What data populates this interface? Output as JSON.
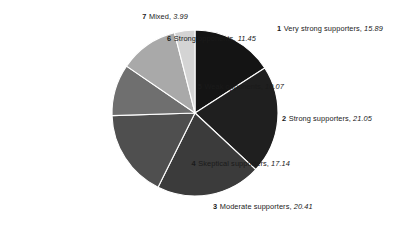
{
  "chart_data": {
    "type": "pie",
    "title": "",
    "subtitle": "",
    "xlabel": "",
    "ylabel": "",
    "legend_position": "outside-labels",
    "grid": false,
    "total": 100.0,
    "units": "percent",
    "start_angle_deg": 0,
    "direction": "clockwise",
    "categories": [
      "Very strong supporters",
      "Strong supporters",
      "Moderate supporters",
      "Skeptical supporters",
      "Weak opponents",
      "Strong opponents",
      "Mixed"
    ],
    "values": [
      15.89,
      21.05,
      20.41,
      17.14,
      10.07,
      11.45,
      3.99
    ],
    "colors": [
      "#141414",
      "#1f1f1f",
      "#3b3b3b",
      "#4f4f4f",
      "#6f6f6f",
      "#a9a9a9",
      "#d4d4d4"
    ],
    "slices": [
      {
        "index": "1",
        "name": "Very strong supporters",
        "value": "15.89",
        "color": "#141414"
      },
      {
        "index": "2",
        "name": "Strong supporters",
        "value": "21.05",
        "color": "#1f1f1f"
      },
      {
        "index": "3",
        "name": "Moderate supporters",
        "value": "20.41",
        "color": "#3b3b3b"
      },
      {
        "index": "4",
        "name": "Skeptical supporters",
        "value": "17.14",
        "color": "#4f4f4f"
      },
      {
        "index": "5",
        "name": "Weak opponents",
        "value": "10.07",
        "color": "#6f6f6f"
      },
      {
        "index": "6",
        "name": "Strong opponents",
        "value": "11.45",
        "color": "#a9a9a9"
      },
      {
        "index": "7",
        "name": "Mixed",
        "value": "3.99",
        "color": "#d4d4d4"
      }
    ]
  },
  "geometry": {
    "center_x": 195,
    "center_y": 113,
    "radius": 83
  },
  "labels": [
    {
      "id": "1",
      "left": 277,
      "top": 25,
      "anchor": "start"
    },
    {
      "id": "2",
      "left": 282,
      "top": 115,
      "anchor": "start"
    },
    {
      "id": "3",
      "left": 213,
      "top": 203,
      "anchor": "start"
    },
    {
      "id": "4",
      "right": 116,
      "top": 160,
      "anchor": "end"
    },
    {
      "id": "5",
      "right": 122,
      "top": 83,
      "anchor": "end"
    },
    {
      "id": "6",
      "right": 150,
      "top": 35,
      "anchor": "end"
    },
    {
      "id": "7",
      "right": 218,
      "top": 13,
      "anchor": "end"
    }
  ],
  "separator": {
    "color": "#ffffff",
    "width": 1.1
  }
}
